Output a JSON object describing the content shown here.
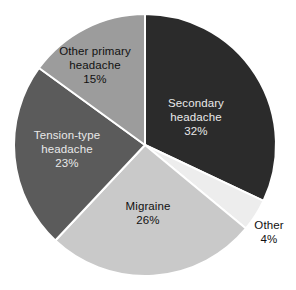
{
  "chart_data": {
    "type": "pie",
    "title": "",
    "categories": [
      "Secondary headache",
      "Other",
      "Migraine",
      "Tension-type headache",
      "Other primary headache"
    ],
    "values": [
      32,
      4,
      26,
      23,
      15
    ],
    "value_suffix": "%",
    "legend": "none",
    "grid": false,
    "slices": [
      {
        "name": "secondary-headache",
        "label_lines": [
          "Secondary",
          "headache"
        ],
        "value_label": "32%",
        "value": 32,
        "color": "#2b2b2b",
        "label_placement": "inside",
        "label_contrast": "dark-bg"
      },
      {
        "name": "other",
        "label_lines": [
          "Other"
        ],
        "value_label": "4%",
        "value": 4,
        "color": "#ededed",
        "label_placement": "outside",
        "label_contrast": "outside"
      },
      {
        "name": "migraine",
        "label_lines": [
          "Migraine"
        ],
        "value_label": "26%",
        "value": 26,
        "color": "#c9c9c9",
        "label_placement": "inside",
        "label_contrast": "light-bg"
      },
      {
        "name": "tension-type-headache",
        "label_lines": [
          "Tension-type",
          "headache"
        ],
        "value_label": "23%",
        "value": 23,
        "color": "#5b5b5b",
        "label_placement": "inside",
        "label_contrast": "dark-bg"
      },
      {
        "name": "other-primary-headache",
        "label_lines": [
          "Other primary",
          "headache"
        ],
        "value_label": "15%",
        "value": 15,
        "color": "#9c9c9c",
        "label_placement": "inside",
        "label_contrast": "light-bg"
      }
    ],
    "geometry": {
      "center_x": 145,
      "center_y": 145,
      "radius": 131,
      "start_angle_deg": 0,
      "direction": "clockwise",
      "separator_color": "#ffffff",
      "separator_width": 2
    },
    "background_color": "#ffffff"
  },
  "labels": {
    "secondary_l1": "Secondary",
    "secondary_l2": "headache",
    "secondary_pct": "32%",
    "other_l1": "Other",
    "other_pct": "4%",
    "migraine_l1": "Migraine",
    "migraine_pct": "26%",
    "tension_l1": "Tension-type",
    "tension_l2": "headache",
    "tension_pct": "23%",
    "otherprimary_l1": "Other primary",
    "otherprimary_l2": "headache",
    "otherprimary_pct": "15%"
  }
}
